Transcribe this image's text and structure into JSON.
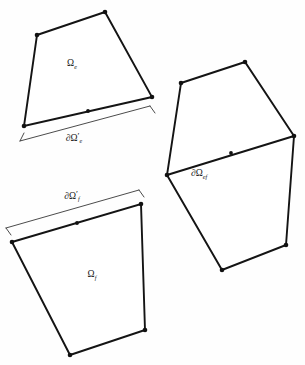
{
  "figure": {
    "background_color": "#fefefe",
    "stroke_color": "#141414",
    "fill_color": "#ffffff",
    "brace_color": "#2a2a2a",
    "width": 305,
    "height": 365
  },
  "labels": {
    "omega_e": {
      "base": "Ω",
      "sub": "e",
      "prime": "",
      "full": "Ωe"
    },
    "omega_f": {
      "base": "Ω",
      "sub": "f",
      "prime": "",
      "full": "Ωf"
    },
    "boundary_e": {
      "base": "∂Ω",
      "prime": "′",
      "sub": "e",
      "full": "∂Ω′e"
    },
    "boundary_f": {
      "base": "∂Ω",
      "prime": "′",
      "sub": "f",
      "full": "∂Ω′f"
    },
    "boundary_ef": {
      "base": "∂Ω",
      "prime": "",
      "sub": "ef",
      "full": "∂Ωef"
    }
  },
  "shapes": {
    "omega_e_polygon": {
      "name": "omega-e-quadrilateral",
      "points": "37,35 105,12 152,97 24,126",
      "vertices": [
        {
          "x": 37,
          "y": 35
        },
        {
          "x": 105,
          "y": 12
        },
        {
          "x": 152,
          "y": 97
        },
        {
          "x": 24,
          "y": 126
        }
      ],
      "midpoints": [
        {
          "x": 88,
          "y": 111
        }
      ]
    },
    "omega_f_polygon": {
      "name": "omega-f-quadrilateral",
      "points": "12,242 141,204 145,330 70,355",
      "vertices": [
        {
          "x": 12,
          "y": 242
        },
        {
          "x": 141,
          "y": 204
        },
        {
          "x": 145,
          "y": 330
        },
        {
          "x": 70,
          "y": 355
        }
      ],
      "midpoints": [
        {
          "x": 77,
          "y": 223
        }
      ]
    },
    "assembled_polygon": {
      "name": "assembled-omega-ef-polygon",
      "points": "181,83 245,62 294,136 286,245 222,270 167,175",
      "vertices": [
        {
          "x": 181,
          "y": 83
        },
        {
          "x": 245,
          "y": 62
        },
        {
          "x": 294,
          "y": 136
        },
        {
          "x": 286,
          "y": 245
        },
        {
          "x": 222,
          "y": 270
        },
        {
          "x": 167,
          "y": 175
        }
      ],
      "interface_edge": {
        "x1": 167,
        "y1": 175,
        "x2": 294,
        "y2": 136
      },
      "midpoints": [
        {
          "x": 231,
          "y": 153
        }
      ]
    }
  },
  "annotations": {
    "brace_e": {
      "name": "brace-boundary-e",
      "path": "M 24,133 L 20,141 M 20,141 L 150,106 M 150,106 L 155,113",
      "label_position": {
        "x": 74,
        "y": 139
      }
    },
    "brace_f": {
      "name": "brace-boundary-f",
      "path": "M 11,235 L 6,228 M 6,228 L 139,190 M 139,190 L 144,197",
      "label_position": {
        "x": 55,
        "y": 201
      }
    },
    "label_ef": {
      "name": "label-boundary-ef",
      "label_position": {
        "x": 191,
        "y": 175
      }
    }
  }
}
